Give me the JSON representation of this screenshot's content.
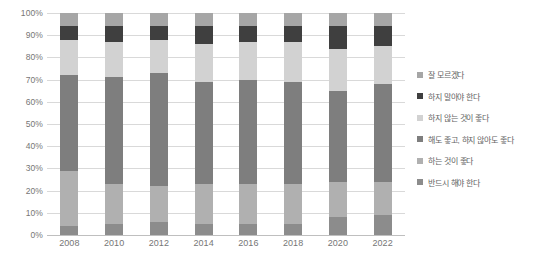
{
  "chart_data": {
    "type": "bar",
    "subtype": "100% stacked column",
    "title": "",
    "subtitle": "",
    "xlabel": "",
    "ylabel": "",
    "categories": [
      "2008",
      "2010",
      "2012",
      "2014",
      "2016",
      "2018",
      "2020",
      "2022"
    ],
    "ylim": [
      0,
      100
    ],
    "ytick_labels": [
      "0%",
      "10%",
      "20%",
      "30%",
      "40%",
      "50%",
      "60%",
      "70%",
      "80%",
      "90%",
      "100%"
    ],
    "ytick_values": [
      0,
      10,
      20,
      30,
      40,
      50,
      60,
      70,
      80,
      90,
      100
    ],
    "grid": true,
    "grid_axis": "y",
    "legend_position": "right",
    "stack_order_bottom_to_top": [
      "반드시 해야 한다",
      "하는 것이 좋다",
      "해도 좋고, 하지 않아도 좋다",
      "하지 않는 것이 좋다",
      "하지 말아야 한다",
      "잘 모르겠다"
    ],
    "series": [
      {
        "name": "반드시 해야 한다",
        "color": "#8c8c8c",
        "values": [
          4,
          5,
          6,
          5,
          5,
          5,
          8,
          9
        ]
      },
      {
        "name": "하는 것이 좋다",
        "color": "#b0b0b0",
        "values": [
          25,
          18,
          16,
          18,
          18,
          18,
          16,
          15
        ]
      },
      {
        "name": "해도 좋고, 하지 않아도 좋다",
        "color": "#7e7e7e",
        "values": [
          43,
          48,
          51,
          46,
          47,
          46,
          41,
          44
        ]
      },
      {
        "name": "하지 않는 것이 좋다",
        "color": "#d2d2d2",
        "values": [
          16,
          16,
          15,
          17,
          17,
          18,
          19,
          17
        ]
      },
      {
        "name": "하지 말아야 한다",
        "color": "#3f3f3f",
        "values": [
          6,
          7,
          6,
          8,
          7,
          7,
          10,
          9
        ]
      },
      {
        "name": "잘 모르겠다",
        "color": "#a6a6a6",
        "values": [
          6,
          6,
          6,
          6,
          6,
          6,
          6,
          6
        ]
      }
    ]
  },
  "legend": {
    "items": [
      {
        "label": "잘 모르겠다",
        "color": "#a6a6a6"
      },
      {
        "label": "하지 말아야 한다",
        "color": "#3f3f3f"
      },
      {
        "label": "하지 않는 것이 좋다",
        "color": "#d2d2d2"
      },
      {
        "label": "해도 좋고, 하지 않아도 좋다",
        "color": "#7e7e7e"
      },
      {
        "label": "하는 것이 좋다",
        "color": "#b0b0b0"
      },
      {
        "label": "반드시 해야 한다",
        "color": "#8c8c8c"
      }
    ]
  },
  "style": {
    "grid_color": "#d9d9d9",
    "axis_color": "#bfbfbf",
    "tick_text_color": "#767676",
    "legend_text_color": "#636363",
    "background": "#ffffff"
  }
}
